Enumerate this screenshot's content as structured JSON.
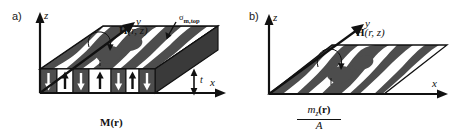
{
  "figure": {
    "width": 469,
    "height": 136,
    "background": "#ffffff",
    "stroke_color": "#111111",
    "domain_dark_color": "#4d4d4d",
    "domain_light_color": "#ffffff",
    "slab_side_color": "#3a3a3a"
  },
  "panels": [
    {
      "id": "a",
      "letter": "a)",
      "axes": {
        "z_label": "z",
        "y_label": "y",
        "x_label": "x"
      },
      "labels": {
        "field": "H(r, z)",
        "field_bold_part": "H",
        "field_args": "(r, z)",
        "surface_charge": "σ",
        "surface_charge_subscript": "m,top",
        "magnetization": "M(r)",
        "magnetization_bold_part": "M",
        "magnetization_args": "(r)",
        "thickness": "t"
      },
      "magnetization_cells": [
        {
          "index": 0,
          "direction": "down",
          "cell_fill": "dark",
          "arrow_color": "white"
        },
        {
          "index": 1,
          "direction": "up",
          "cell_fill": "light",
          "arrow_color": "black"
        },
        {
          "index": 2,
          "direction": "down",
          "cell_fill": "dark",
          "arrow_color": "white"
        },
        {
          "index": 3,
          "direction": "up",
          "cell_fill": "light",
          "arrow_color": "black"
        },
        {
          "index": 4,
          "direction": "down",
          "cell_fill": "dark",
          "arrow_color": "white"
        },
        {
          "index": 5,
          "direction": "up",
          "cell_fill": "light",
          "arrow_color": "black"
        },
        {
          "index": 6,
          "direction": "down",
          "cell_fill": "dark",
          "arrow_color": "white"
        }
      ]
    },
    {
      "id": "b",
      "letter": "b)",
      "axes": {
        "z_label": "z",
        "y_label": "y",
        "x_label": "x"
      },
      "labels": {
        "field": "H(r, z)",
        "field_bold_part": "H",
        "field_args": "(r, z)",
        "sheet_numerator": "m",
        "sheet_numerator_subscript": "z",
        "sheet_numerator_args": "(r)",
        "sheet_denominator": "A"
      }
    }
  ],
  "icons": {
    "up_arrow": "magnetization-up-arrow-icon",
    "down_arrow": "magnetization-down-arrow-icon",
    "double_arrow": "thickness-double-arrow-icon",
    "axis_arrow": "axis-arrowhead-icon",
    "pointer_arrow": "surface-charge-pointer-arrow-icon",
    "field_arrow": "field-vector-arrow-icon"
  }
}
